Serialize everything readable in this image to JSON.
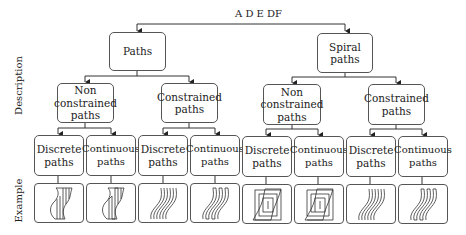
{
  "top_label": "A   D  E DF",
  "row_labels": {
    "description": "Description",
    "example": "Example"
  },
  "tree": {
    "roots": [
      {
        "label": "Paths"
      },
      {
        "label": "Spiral paths"
      }
    ],
    "level2": [
      {
        "label": "Non constrained paths",
        "parent": "Paths"
      },
      {
        "label": "Constrained paths",
        "parent": "Paths"
      },
      {
        "label": "Non constrained paths",
        "parent": "Spiral paths"
      },
      {
        "label": "Constrained paths",
        "parent": "Spiral paths"
      }
    ],
    "level3": [
      {
        "label": "Discrete paths",
        "example": "zigzag-discrete"
      },
      {
        "label": "Continuous paths",
        "example": "zigzag-continuous"
      },
      {
        "label": "Discrete paths",
        "example": "parallel-offset-discrete"
      },
      {
        "label": "Continuous paths",
        "example": "parallel-offset-continuous"
      },
      {
        "label": "Discrete paths",
        "example": "spiral-discrete"
      },
      {
        "label": "Continuous paths",
        "example": "spiral-continuous"
      },
      {
        "label": "Discrete paths",
        "example": "parallel-offset-discrete"
      },
      {
        "label": "Continuous paths",
        "example": "parallel-offset-continuous"
      }
    ]
  },
  "colors": {
    "line": "#333333",
    "border": "#555555"
  }
}
